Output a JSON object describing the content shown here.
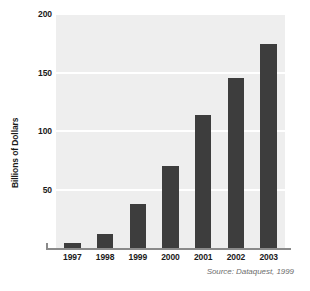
{
  "chart_data": {
    "type": "bar",
    "title": "",
    "subtitle": "",
    "xlabel": "",
    "ylabel": "Billions of Dollars",
    "categories": [
      "1997",
      "1998",
      "1999",
      "2000",
      "2001",
      "2002",
      "2003"
    ],
    "values": [
      4,
      12,
      38,
      70,
      114,
      145,
      174
    ],
    "series": [
      {
        "name": "Billions of Dollars",
        "values": [
          4,
          12,
          38,
          70,
          114,
          145,
          174
        ]
      }
    ],
    "ylim": [
      0,
      200
    ],
    "yticks": [
      50,
      100,
      150,
      200
    ],
    "ytick_labels": [
      "50",
      "100",
      "150",
      "200"
    ],
    "grid": true,
    "gridlines_at": [
      50,
      100,
      150,
      200
    ],
    "legend": false,
    "legend_position": "none",
    "annotations": [
      "Source: Dataquest, 1999"
    ],
    "bar_color": "#3d3d3d",
    "plot_background": "#eeeeee",
    "gridline_color": "#ffffff",
    "axis_color": "#8a8a8a",
    "text_color": "#1a1a1a"
  },
  "source": {
    "text": "Source: Dataquest, 1999"
  }
}
